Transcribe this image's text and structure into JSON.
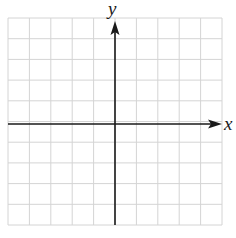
{
  "diagram": {
    "type": "coordinate-plane",
    "grid": {
      "columns": 10,
      "rows": 10,
      "left": 8,
      "top": 18,
      "right": 222,
      "bottom": 225,
      "line_color": "#d4d4d4"
    },
    "axes": {
      "color": "#1a1a1a",
      "x_label": "x",
      "y_label": "y",
      "x_axis_y": 124,
      "y_axis_x": 115
    }
  }
}
